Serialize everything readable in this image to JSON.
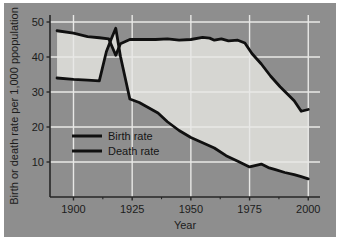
{
  "figure": {
    "background_color": "#8e8e8e",
    "plot_background_color": "#8e8e8e",
    "band_fill_color": "#d6d6d2",
    "grid_color": "#e8e8e6",
    "axis_color": "#262626",
    "line_color": "#101010"
  },
  "chart_data": {
    "type": "line",
    "title": "",
    "xlabel": "Year",
    "ylabel": "Birth or death rate per 1,000 ppopulation",
    "xlim": [
      1890,
      2005
    ],
    "ylim": [
      0,
      52
    ],
    "xticks": [
      1900,
      1925,
      1950,
      1975,
      2000
    ],
    "xtick_labels": [
      "1900",
      "1925",
      "1950",
      "1975",
      "2000"
    ],
    "yticks": [
      10,
      20,
      30,
      40,
      50
    ],
    "ytick_labels": [
      "10",
      "20",
      "30",
      "40",
      "50"
    ],
    "grid": true,
    "legend_position": "center-left",
    "fill_between_series": true,
    "series": [
      {
        "name": "Birth rate",
        "color": "#101010",
        "x": [
          1893,
          1900,
          1906,
          1911,
          1915,
          1918,
          1920,
          1924,
          1930,
          1935,
          1940,
          1945,
          1950,
          1955,
          1958,
          1960,
          1963,
          1966,
          1970,
          1973,
          1976,
          1980,
          1984,
          1988,
          1991,
          1994,
          1997,
          2000
        ],
        "values": [
          47.5,
          46.8,
          45.8,
          45.5,
          45.2,
          40.5,
          43.8,
          45.0,
          45.0,
          45.0,
          45.2,
          44.8,
          45.0,
          45.6,
          45.4,
          44.8,
          45.2,
          44.6,
          44.8,
          44.0,
          41.0,
          38.0,
          34.5,
          31.5,
          29.5,
          27.5,
          24.5,
          25.0
        ]
      },
      {
        "name": "Death rate",
        "color": "#101010",
        "x": [
          1893,
          1900,
          1906,
          1911,
          1914,
          1916,
          1918,
          1920,
          1924,
          1928,
          1932,
          1936,
          1940,
          1945,
          1950,
          1955,
          1960,
          1965,
          1970,
          1975,
          1980,
          1983,
          1986,
          1990,
          1994,
          1997,
          2000
        ],
        "values": [
          34.0,
          33.6,
          33.4,
          33.2,
          41.5,
          45.0,
          48.2,
          40.2,
          28.0,
          27.0,
          25.5,
          24.0,
          21.5,
          19.0,
          17.0,
          15.5,
          14.0,
          11.8,
          10.2,
          8.6,
          9.4,
          8.4,
          7.8,
          7.0,
          6.4,
          5.8,
          5.2
        ]
      }
    ]
  },
  "legend": {
    "items": [
      {
        "label": "Birth rate",
        "swatch_color": "#101010"
      },
      {
        "label": "Death rate",
        "swatch_color": "#101010"
      }
    ]
  }
}
